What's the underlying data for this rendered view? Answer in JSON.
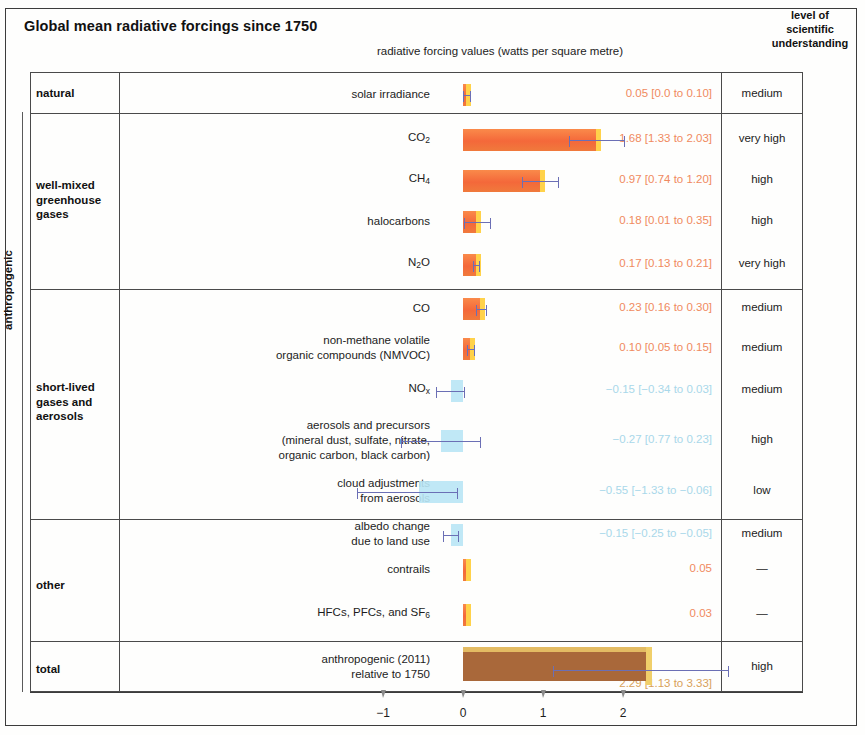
{
  "header": {
    "title": "Global mean radiative forcings since 1750",
    "axis_caption": "radiative forcing values (watts per square metre)",
    "lou_header": "level of\nscientific\nunderstanding",
    "lou_line1": "level of",
    "lou_line2": "scientific",
    "lou_line3": "understanding",
    "bracket_label": "anthropogenic"
  },
  "groups": [
    {
      "name": "natural"
    },
    {
      "name": "well-mixed\ngreenhouse\ngases",
      "l1": "well-mixed",
      "l2": "greenhouse",
      "l3": "gases"
    },
    {
      "name": "short-lived\ngases and\naerosols",
      "l1": "short-lived",
      "l2": "gases and",
      "l3": "aerosols"
    },
    {
      "name": "other"
    },
    {
      "name": "total"
    }
  ],
  "rows": [
    {
      "group": "natural",
      "name": "solar irradiance",
      "name_html": "solar irradiance",
      "value": 0.05,
      "low": 0.0,
      "high": 0.1,
      "value_text": "0.05 [0.0 to 0.10]",
      "lou": "medium",
      "sign": "pos"
    },
    {
      "group": "well-mixed greenhouse gases",
      "name": "CO2",
      "name_html": "CO<sub>2</sub>",
      "value": 1.68,
      "low": 1.33,
      "high": 2.03,
      "value_text": "1.68 [1.33 to 2.03]",
      "lou": "very high",
      "sign": "pos"
    },
    {
      "group": "well-mixed greenhouse gases",
      "name": "CH4",
      "name_html": "CH<sub>4</sub>",
      "value": 0.97,
      "low": 0.74,
      "high": 1.2,
      "value_text": "0.97 [0.74 to 1.20]",
      "lou": "high",
      "sign": "pos"
    },
    {
      "group": "well-mixed greenhouse gases",
      "name": "halocarbons",
      "name_html": "halocarbons",
      "value": 0.18,
      "low": 0.01,
      "high": 0.35,
      "value_text": "0.18 [0.01 to 0.35]",
      "lou": "high",
      "sign": "pos"
    },
    {
      "group": "well-mixed greenhouse gases",
      "name": "N2O",
      "name_html": "N<sub>2</sub>O",
      "value": 0.17,
      "low": 0.13,
      "high": 0.21,
      "value_text": "0.17 [0.13 to 0.21]",
      "lou": "very high",
      "sign": "pos"
    },
    {
      "group": "short-lived gases and aerosols",
      "name": "CO",
      "name_html": "CO",
      "value": 0.23,
      "low": 0.16,
      "high": 0.3,
      "value_text": "0.23 [0.16 to 0.30]",
      "lou": "medium",
      "sign": "pos"
    },
    {
      "group": "short-lived gases and aerosols",
      "name": "non-methane volatile organic compounds (NMVOC)",
      "name_html": "non-methane volatile<br>organic compounds (NMVOC)",
      "value": 0.1,
      "low": 0.05,
      "high": 0.15,
      "value_text": "0.10 [0.05 to 0.15]",
      "lou": "medium",
      "sign": "pos"
    },
    {
      "group": "short-lived gases and aerosols",
      "name": "NOx",
      "name_html": "NO<sub>x</sub>",
      "value": -0.15,
      "low": -0.34,
      "high": 0.03,
      "value_text": "−0.15 [−0.34 to 0.03]",
      "lou": "medium",
      "sign": "neg"
    },
    {
      "group": "short-lived gases and aerosols",
      "name": "aerosols and precursors (mineral dust, sulfate, nitrate, organic carbon, black carbon)",
      "name_html": "aerosols and precursors<br>(mineral dust, sulfate, nitrate,<br>organic carbon, black carbon)",
      "value": -0.27,
      "low": -0.77,
      "high": 0.23,
      "value_text": "−0.27 [0.77 to 0.23]",
      "lou": "high",
      "sign": "neg"
    },
    {
      "group": "short-lived gases and aerosols",
      "name": "cloud adjustments from aerosols",
      "name_html": "cloud adjustments<br>from aerosols",
      "value": -0.55,
      "low": -1.33,
      "high": -0.06,
      "value_text": "−0.55 [−1.33 to −0.06]",
      "lou": "low",
      "sign": "neg"
    },
    {
      "group": "other",
      "name": "albedo change due to land use",
      "name_html": "albedo change<br>due to land use",
      "value": -0.15,
      "low": -0.25,
      "high": -0.05,
      "value_text": "−0.15 [−0.25 to −0.05]",
      "lou": "medium",
      "sign": "neg"
    },
    {
      "group": "other",
      "name": "contrails",
      "name_html": "contrails",
      "value": 0.05,
      "low": null,
      "high": null,
      "value_text": "0.05",
      "lou": "—",
      "sign": "pos"
    },
    {
      "group": "other",
      "name": "HFCs, PFCs, and SF6",
      "name_html": "HFCs, PFCs, and SF<sub>6</sub>",
      "value": 0.03,
      "low": null,
      "high": null,
      "value_text": "0.03",
      "lou": "—",
      "sign": "pos"
    },
    {
      "group": "total",
      "name": "anthropogenic (2011) relative to 1750",
      "name_html": "anthropogenic (2011)<br>relative to 1750",
      "value": 2.29,
      "low": 1.13,
      "high": 3.33,
      "value_text": "2.29 [1.13 to 3.33]",
      "lou": "high",
      "sign": "tot"
    }
  ],
  "axis": {
    "ticks": [
      -1,
      0,
      1,
      2
    ],
    "tick_labels": [
      "−1",
      "0",
      "1",
      "2"
    ],
    "min": -1.6,
    "max": 2.6
  },
  "colors": {
    "positive_bar": "#f4683a",
    "positive_bar_edge": "#ffd24a",
    "negative_bar": "#b9e6f5",
    "total_bar": "#a9683a",
    "total_bar_edge": "#f0cf6a",
    "error_bar": "#6b6fb5",
    "positive_value_text": "#f08a60",
    "negative_value_text": "#a9d8ea",
    "total_value_text": "#d8a15a",
    "rule": "#4a4a4a"
  },
  "chart_data": {
    "type": "bar",
    "title": "Global mean radiative forcings since 1750",
    "xlabel": "radiative forcing values (watts per square metre)",
    "ylabel": "",
    "orientation": "horizontal",
    "xlim": [
      -1.6,
      2.6
    ],
    "xticks": [
      -1,
      0,
      1,
      2
    ],
    "grid": false,
    "legend": "none",
    "categories": [
      "solar irradiance",
      "CO2",
      "CH4",
      "halocarbons",
      "N2O",
      "CO",
      "non-methane volatile organic compounds (NMVOC)",
      "NOx",
      "aerosols and precursors (mineral dust, sulfate, nitrate, organic carbon, black carbon)",
      "cloud adjustments from aerosols",
      "albedo change due to land use",
      "contrails",
      "HFCs, PFCs, and SF6",
      "anthropogenic (2011) relative to 1750"
    ],
    "values": [
      0.05,
      1.68,
      0.97,
      0.18,
      0.17,
      0.23,
      0.1,
      -0.15,
      -0.27,
      -0.55,
      -0.15,
      0.05,
      0.03,
      2.29
    ],
    "error_low": [
      0.0,
      1.33,
      0.74,
      0.01,
      0.13,
      0.16,
      0.05,
      -0.34,
      -0.77,
      -1.33,
      -0.25,
      null,
      null,
      1.13
    ],
    "error_high": [
      0.1,
      2.03,
      1.2,
      0.35,
      0.21,
      0.3,
      0.15,
      0.03,
      0.23,
      -0.06,
      -0.05,
      null,
      null,
      3.33
    ],
    "level_of_scientific_understanding": [
      "medium",
      "very high",
      "high",
      "high",
      "very high",
      "medium",
      "medium",
      "medium",
      "high",
      "low",
      "medium",
      "—",
      "—",
      "high"
    ]
  }
}
